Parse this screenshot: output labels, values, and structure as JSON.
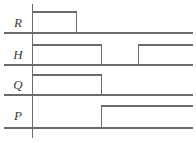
{
  "figure": {
    "type": "timing-diagram",
    "width": 196,
    "height": 143,
    "background": "#ffffff",
    "line_color": "#6b6b6b",
    "axis_color": "#6b6b6b",
    "label_color": "#3b3b3b",
    "axis_x": 32.5,
    "axis_top": 4,
    "axis_bottom": 138,
    "right_edge": 193
  },
  "signals": [
    {
      "name": "R",
      "label": "R",
      "label_x": 18,
      "label_y": 27,
      "high_y": 12,
      "low_y": 33,
      "initial_level": "high",
      "transitions": [
        {
          "x": 76.5,
          "edge": "falling"
        }
      ]
    },
    {
      "name": "H",
      "label": "H",
      "label_x": 18,
      "label_y": 59,
      "high_y": 45,
      "low_y": 65,
      "initial_level": "high",
      "transitions": [
        {
          "x": 101.5,
          "edge": "falling"
        },
        {
          "x": 138.5,
          "edge": "rising"
        }
      ]
    },
    {
      "name": "Q",
      "label": "Q",
      "label_x": 18,
      "label_y": 89,
      "high_y": 75,
      "low_y": 95,
      "initial_level": "high",
      "transitions": [
        {
          "x": 101.5,
          "edge": "falling"
        }
      ]
    },
    {
      "name": "P",
      "label": "P",
      "label_x": 18,
      "label_y": 120,
      "high_y": 106,
      "low_y": 128,
      "initial_level": "low",
      "transitions": [
        {
          "x": 101.5,
          "edge": "rising"
        }
      ]
    }
  ]
}
